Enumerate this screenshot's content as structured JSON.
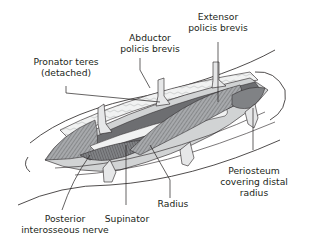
{
  "figure": {
    "labels": {
      "abductor_line1": "Abductor",
      "abductor_line2": "policis brevis",
      "extensor_line1": "Extensor",
      "extensor_line2": "policis brevis",
      "pronator_line1": "Pronator teres",
      "pronator_line2": "(detached)",
      "periosteum_line1": "Periosteum",
      "periosteum_line2": "covering distal",
      "periosteum_line3": "radius",
      "posterior_line1": "Posterior",
      "posterior_line2": "interosseous nerve",
      "supinator": "Supinator",
      "radius": "Radius"
    },
    "colors": {
      "line": "#231f20",
      "muscle_dark": "#6d6e71",
      "muscle_mid": "#939598",
      "muscle_light": "#bcbec0",
      "retractor": "#e6e7e8",
      "skin": "#ffffff"
    }
  }
}
